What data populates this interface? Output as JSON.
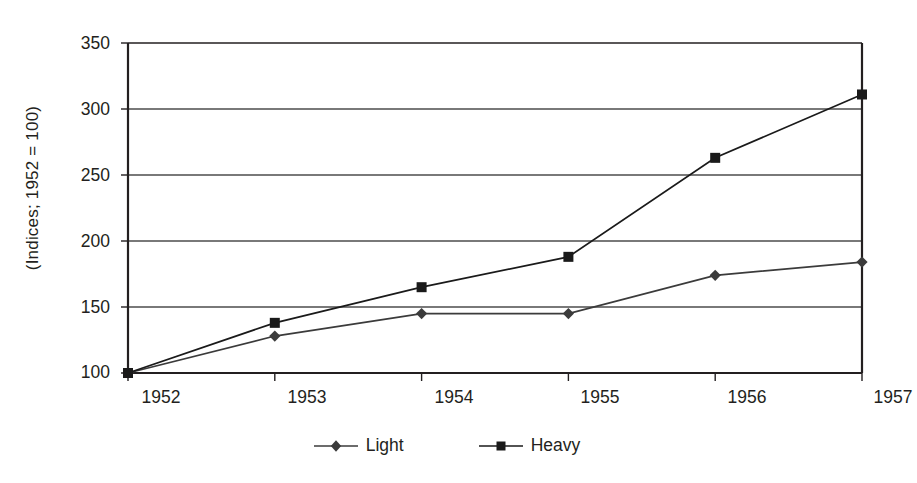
{
  "chart_data": {
    "type": "line",
    "title": "",
    "subtitle": "",
    "xlabel": "",
    "ylabel": "(Indices; 1952 = 100)",
    "categories": [
      "1952",
      "1953",
      "1954",
      "1955",
      "1956",
      "1957"
    ],
    "x": [
      1952,
      1953,
      1954,
      1955,
      1956,
      1957
    ],
    "series": [
      {
        "name": "Light",
        "marker": "diamond",
        "color": "#3b3b3b",
        "values": [
          100,
          128,
          145,
          145,
          174,
          184
        ]
      },
      {
        "name": "Heavy",
        "marker": "square",
        "color": "#1a1a1a",
        "values": [
          100,
          138,
          165,
          188,
          263,
          311
        ]
      }
    ],
    "ylim": [
      100,
      350
    ],
    "yticks": [
      100,
      150,
      200,
      250,
      300,
      350
    ],
    "ytick_labels": [
      "100",
      "150",
      "200",
      "250",
      "300",
      "350"
    ],
    "xtick_labels": [
      "1952",
      "1953",
      "1954",
      "1955",
      "1956",
      "1957"
    ],
    "grid": "horizontal",
    "legend_position": "bottom-center",
    "annotations": []
  },
  "colors": {
    "frame": "#231f20",
    "gridline": "#4d4d4d",
    "light_series": "#3b3b3b",
    "heavy_series": "#1a1a1a",
    "background": "#ffffff",
    "text": "#231f20"
  },
  "legend": {
    "items": [
      {
        "label": "Light",
        "marker": "diamond-marker-icon"
      },
      {
        "label": "Heavy",
        "marker": "square-marker-icon"
      }
    ]
  }
}
